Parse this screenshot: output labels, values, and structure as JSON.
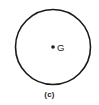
{
  "figure": {
    "shape": "circle",
    "center": [
      53,
      47
    ],
    "radius": 37.5,
    "stroke_color": "#1a1a1a",
    "stroke_width": 1.6,
    "point": {
      "label": "G",
      "x": 53,
      "y": 47,
      "meaning": "centroid"
    },
    "caption": "(c)"
  }
}
